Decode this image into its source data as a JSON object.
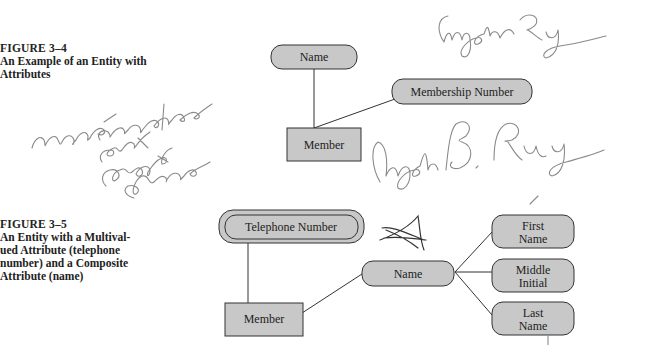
{
  "figures": [
    {
      "number": "FIGURE 3–4",
      "caption": "An Example of an Entity with Attributes",
      "entity": "Member",
      "attributes": [
        "Name",
        "Membership Number"
      ]
    },
    {
      "number": "FIGURE 3–5",
      "caption_lines": [
        "An Entity with a Multival-",
        "ued Attribute (telephone",
        "number) and a Composite",
        "Attribute (name)"
      ],
      "entity": "Member",
      "multivalued_attribute": "Telephone Number",
      "composite_attribute": "Name",
      "components": [
        "First Name",
        "Middle Initial",
        "Last Name"
      ],
      "component_lines": [
        [
          "First",
          "Name"
        ],
        [
          "Middle",
          "Initial"
        ],
        [
          "Last",
          "Name"
        ]
      ]
    }
  ],
  "handwriting": {
    "top_signature": "Angela Roy",
    "middle_signature": "Angela B. Roy",
    "left_note": "name- composite fact break down",
    "mark": "A"
  },
  "colors": {
    "shape_fill": "#c8c8c8",
    "stroke": "#333333",
    "ink": "#8a8a8a"
  }
}
